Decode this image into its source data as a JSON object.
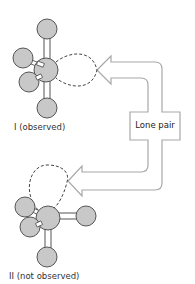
{
  "diagram": {
    "callout": {
      "label": "Lone pair"
    },
    "structures": [
      {
        "id": "I",
        "label": "I (observed)"
      },
      {
        "id": "II",
        "label": "II (not observed)"
      }
    ],
    "colors": {
      "atom_fill": "#c8c8c8",
      "atom_stroke": "#555555",
      "bond_stroke": "#555555",
      "lobe_stroke": "#444444",
      "arrow_stroke": "#a0a0a0"
    }
  }
}
